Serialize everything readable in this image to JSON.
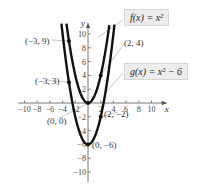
{
  "chart_data": {
    "type": "line",
    "title": "",
    "xlabel": "x",
    "ylabel": "y",
    "xlim": [
      -10,
      10
    ],
    "ylim": [
      -10,
      10
    ],
    "x_ticks": [
      -10,
      -8,
      -6,
      -4,
      -2,
      2,
      4,
      6,
      8,
      10
    ],
    "y_ticks": [
      10,
      8,
      6,
      4,
      2,
      -2,
      -4,
      -6,
      -8,
      -10
    ],
    "x_tick_labels": [
      "−10",
      "−8",
      "−6",
      "−4",
      "−2",
      "2",
      "4",
      "6",
      "8",
      "10"
    ],
    "y_tick_labels": [
      "10",
      "8",
      "6",
      "4",
      "2",
      "−2",
      "−4",
      "−6",
      "−8",
      "−10"
    ],
    "grid": false,
    "series": [
      {
        "name": "f(x) = x²",
        "expression": "x^2",
        "points": [
          [
            -3,
            9
          ],
          [
            0,
            0
          ],
          [
            2,
            4
          ]
        ]
      },
      {
        "name": "g(x) = x² − 6",
        "expression": "x^2 - 6",
        "points": [
          [
            -3,
            3
          ],
          [
            0,
            -6
          ],
          [
            2,
            -2
          ]
        ]
      }
    ],
    "annotations": [
      "(−3, 9)",
      "(−3, 3)",
      "(0, 0)",
      "(2, 4)",
      "(2, −2)",
      "(0, −6)"
    ],
    "legend": [
      "f(x) = x²",
      "g(x) = x² − 6"
    ]
  },
  "labels": {
    "f_box": "f(x) = x²",
    "g_box": "g(x) = x² − 6",
    "pt_m3_9": "(−3, 9)",
    "pt_m3_3": "(−3, 3)",
    "pt_0_0": "(0, 0)",
    "pt_2_4": "(2, 4)",
    "pt_2_m2": "(2, −2)",
    "pt_0_m6": "(0, −6)",
    "x_axis": "x",
    "y_axis": "y"
  }
}
